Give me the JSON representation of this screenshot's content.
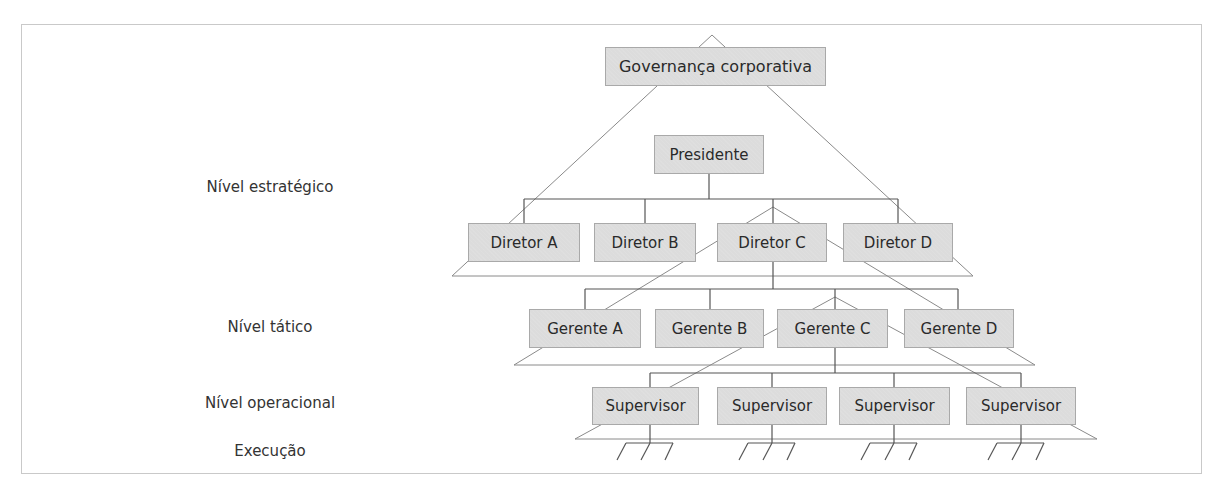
{
  "levels": [
    {
      "label": "Nível estratégico",
      "x": 270,
      "y": 188
    },
    {
      "label": "Nível tático",
      "x": 270,
      "y": 328
    },
    {
      "label": "Nível operacional",
      "x": 270,
      "y": 404
    },
    {
      "label": "Execução",
      "x": 270,
      "y": 452
    }
  ],
  "governance": {
    "label": "Governança corporativa"
  },
  "president": {
    "label": "Presidente"
  },
  "directors": [
    {
      "label": "Diretor A"
    },
    {
      "label": "Diretor B"
    },
    {
      "label": "Diretor C"
    },
    {
      "label": "Diretor D"
    }
  ],
  "managers": [
    {
      "label": "Gerente A"
    },
    {
      "label": "Gerente B"
    },
    {
      "label": "Gerente C"
    },
    {
      "label": "Gerente D"
    }
  ],
  "supervisors": [
    {
      "label": "Supervisor"
    },
    {
      "label": "Supervisor"
    },
    {
      "label": "Supervisor"
    },
    {
      "label": "Supervisor"
    }
  ],
  "colors": {
    "box_fill": "#dcdcdc",
    "box_border": "#a9a9a9",
    "connector": "#555555",
    "pyramid_line": "#8a8a8a",
    "frame": "#c9c9c9"
  }
}
